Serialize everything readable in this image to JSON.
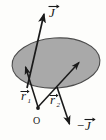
{
  "figure": {
    "type": "vector-diagram",
    "background_color": "#fdfdfb",
    "surface": {
      "name": "elliptical-plane",
      "fill_color": "#a9a9a9",
      "stroke_color": "#4d4d4d",
      "center": [
        56,
        63
      ],
      "radius_x": 44,
      "radius_y": 25,
      "rotation_deg": -4
    },
    "ink_color": "#1a1a1a",
    "labels": {
      "j_up": "J",
      "j_down_sign": "−",
      "j_down": "J",
      "r1": "r",
      "r1_sub": "1",
      "r2": "r",
      "r2_sub": "2",
      "origin": "O"
    },
    "vectors": [
      {
        "name": "J-up",
        "label": "J",
        "from": [
          27,
          88
        ],
        "to": [
          44,
          12
        ],
        "arrowhead": "tip",
        "note": "long arrow pointing up-right, passes through the plane"
      },
      {
        "name": "r1",
        "label": "r1",
        "from": [
          38,
          108
        ],
        "to": [
          25,
          66
        ],
        "arrowhead": "tip",
        "note": "from origin O up-left to a point inside the ellipse"
      },
      {
        "name": "r2",
        "label": "r2",
        "from": [
          38,
          108
        ],
        "to": [
          80,
          62
        ],
        "arrowhead": "tip",
        "note": "from origin O up-right to a point inside the ellipse"
      },
      {
        "name": "J-down",
        "label": "-J",
        "from": [
          58,
          88
        ],
        "to": [
          70,
          125
        ],
        "arrowhead": "tip",
        "note": "arrow pointing down-right below the plane"
      }
    ],
    "points": [
      {
        "name": "origin-point",
        "at": [
          38,
          108
        ],
        "marker": "dot"
      },
      {
        "name": "r1-endpoint",
        "at": [
          25,
          66
        ],
        "marker": "arrow-tip"
      },
      {
        "name": "r2-endpoint",
        "at": [
          80,
          62
        ],
        "marker": "arrow-tip"
      }
    ]
  }
}
